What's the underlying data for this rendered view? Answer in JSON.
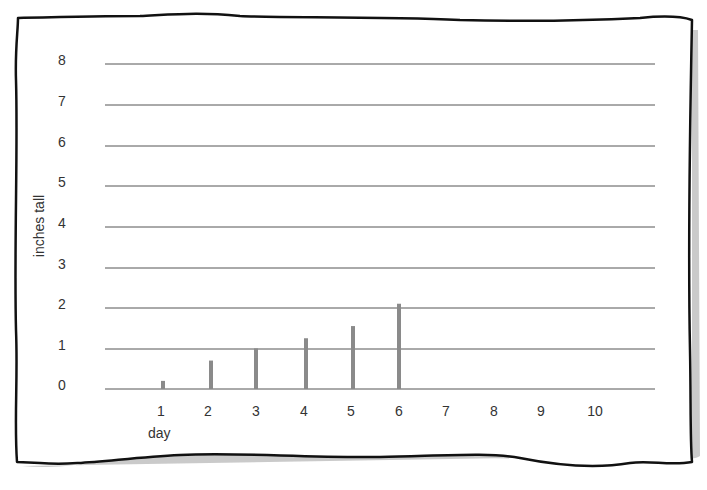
{
  "chart_data": {
    "type": "bar",
    "title": "",
    "xlabel": "day",
    "ylabel": "inches tall",
    "categories": [
      "1",
      "2",
      "3",
      "4",
      "5",
      "6",
      "7",
      "8",
      "9",
      "10"
    ],
    "values": [
      0.2,
      0.7,
      1.0,
      1.25,
      1.55,
      2.1,
      null,
      null,
      null,
      null
    ],
    "x_ticks": [
      "1",
      "2",
      "3",
      "4",
      "5",
      "6",
      "7",
      "8",
      "9",
      "10"
    ],
    "y_ticks": [
      "0",
      "1",
      "2",
      "3",
      "4",
      "5",
      "6",
      "7",
      "8"
    ],
    "ylim": [
      0,
      8
    ],
    "grid": true,
    "legend": null,
    "bar_color": "#8a8a8a",
    "grid_color": "#555555"
  }
}
